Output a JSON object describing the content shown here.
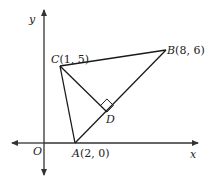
{
  "diagram": {
    "type": "coordinate-geometry",
    "axes": {
      "x_label": "x",
      "y_label": "y",
      "origin_label": "O"
    },
    "points": {
      "A": {
        "name": "A",
        "coords": "(2, 0)",
        "x": 2,
        "y": 0
      },
      "B": {
        "name": "B",
        "coords": "(8, 6)",
        "x": 8,
        "y": 6
      },
      "C": {
        "name": "C",
        "coords": "(1, 5)",
        "x": 1,
        "y": 5
      },
      "D": {
        "name": "D",
        "coords": "",
        "note": "foot of perpendicular from C to AB"
      }
    },
    "segments": [
      "AB",
      "BC",
      "CA",
      "CD"
    ],
    "right_angle_at": "D",
    "colors": {
      "line": "#1a1a1a",
      "axis": "#333333",
      "background": "#ffffff"
    }
  }
}
